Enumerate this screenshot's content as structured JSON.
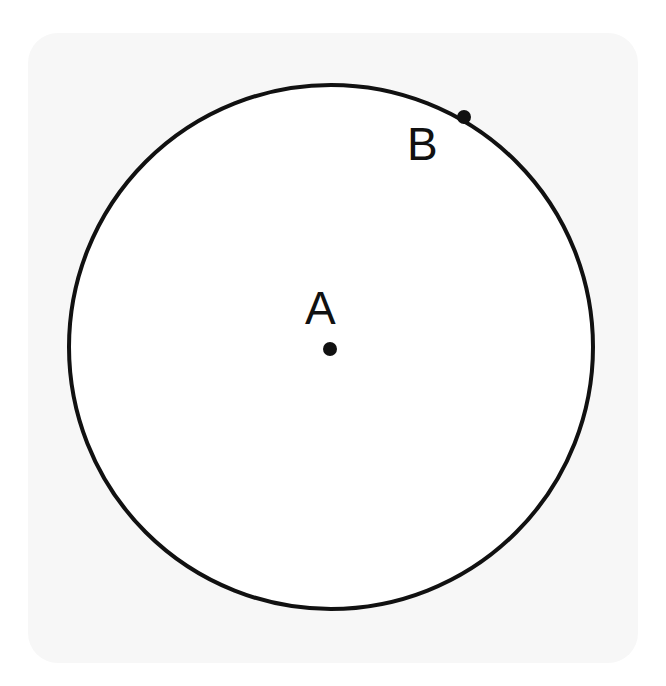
{
  "diagram": {
    "type": "geometry",
    "circle": {
      "cx": 331,
      "cy": 347,
      "r": 262,
      "stroke": "#111111",
      "stroke_width": 4,
      "fill": "#ffffff"
    },
    "points": [
      {
        "label": "A",
        "x": 330,
        "y": 349,
        "label_x": 305,
        "label_y": 324
      },
      {
        "label": "B",
        "x": 464,
        "y": 117,
        "label_x": 407,
        "label_y": 160
      }
    ],
    "colors": {
      "panel": "#f7f7f7",
      "ink": "#111111"
    }
  }
}
